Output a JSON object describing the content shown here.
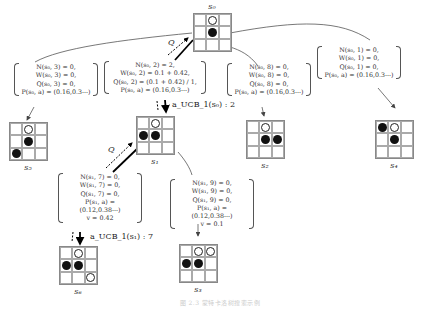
{
  "nodes": {
    "s0": {
      "label": "s₀",
      "stones": {
        "1": "w",
        "4": "b"
      }
    },
    "s5": {
      "label": "s₅",
      "stones": {
        "1": "w",
        "4": "b",
        "6": "b"
      }
    },
    "s1": {
      "label": "s₁",
      "stones": {
        "1": "w",
        "3": "b",
        "4": "b"
      }
    },
    "s2": {
      "label": "s₂",
      "stones": {
        "1": "w",
        "4": "b",
        "5": "b"
      }
    },
    "s4": {
      "label": "s₄",
      "stones": {
        "0": "b",
        "1": "w",
        "4": "b"
      }
    },
    "s6": {
      "label": "s₆",
      "stones": {
        "1": "w",
        "3": "b",
        "4": "b",
        "8": "w"
      }
    },
    "s3": {
      "label": "s₃",
      "stones": {
        "1": "w",
        "2": "w",
        "3": "b",
        "4": "b"
      }
    }
  },
  "stats": {
    "s0_a3": [
      "N(s₀, 3) = 0,",
      "W(s₀, 3) = 0,",
      "Q(s₀, 3) = 0,",
      "P(s₀, a) = (0.16,0.3⋯)"
    ],
    "s0_a2": [
      "N(s₀, 2) = 2,",
      "W(s₀, 2) = 0.1 + 0.42,",
      "Q(s₀, 2) = (0.1 + 0.42) / 1,",
      "P(s₀, a) = (0.16,0.3⋯)"
    ],
    "s0_a8": [
      "N(s₀, 8) = 0,",
      "W(s₀, 8) = 0,",
      "Q(s₀, 8) = 0,",
      "P(s₀, a) = (0.16,0.3⋯)"
    ],
    "s0_a1": [
      "N(s₀, 1) = 0,",
      "W(s₀, 1) = 0,",
      "Q(s₀, 1) = 0,",
      "P(s₀, a) = (0.16,0.3⋯)"
    ],
    "s1_a7": [
      "N(s₁, 7) = 0,",
      "W(s₁, 7) = 0,",
      "Q(s₁, 7) = 0,",
      "P(s₁, a) = (0.12,0.38⋯)",
      "v = 0.42"
    ],
    "s1_a9": [
      "N(s₁, 9) = 0,",
      "W(s₁, 9) = 0,",
      "Q(s₁, 9) = 0,",
      "P(s₁, a) = (0.12,0.38⋯)",
      "v = 0.1"
    ]
  },
  "annotations": {
    "q_top": "Q",
    "q_mid": "Q",
    "ucb_s0": "a_UCB_1(s₀) : 2",
    "ucb_s1": "a_UCB_1(s₁) : 7"
  },
  "caption": "图 2.3  蒙特卡洛树搜索示例"
}
